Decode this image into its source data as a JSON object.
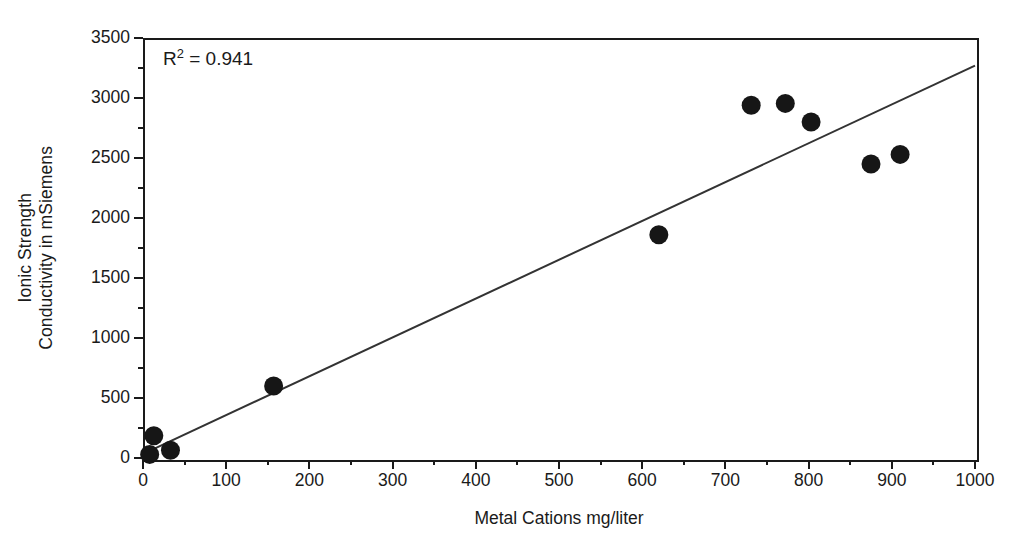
{
  "chart_data": {
    "type": "scatter",
    "title": "",
    "xlabel": "Metal Cations mg/liter",
    "ylabel": "Ionic Strength\nConductivity in mSiemens",
    "ylabel_lines": [
      "Ionic Strength",
      "Conductivity in mSiemens"
    ],
    "xlim": [
      0,
      1000
    ],
    "ylim": [
      0,
      3500
    ],
    "xticks": [
      0,
      100,
      200,
      300,
      400,
      500,
      600,
      700,
      800,
      900,
      1000
    ],
    "yticks": [
      0,
      500,
      1000,
      1500,
      2000,
      2500,
      3000,
      3500
    ],
    "xtick_labels": [
      "0",
      "100",
      "200",
      "300",
      "400",
      "500",
      "600",
      "700",
      "800",
      "900",
      "1000"
    ],
    "ytick_labels": [
      "0",
      "500",
      "1000",
      "1500",
      "2000",
      "2500",
      "3000",
      "3500"
    ],
    "x_minor_ticks": [
      50,
      150,
      250,
      350,
      450,
      550,
      650,
      750,
      850,
      950
    ],
    "y_minor_ticks": [
      250,
      750,
      1250,
      1750,
      2250,
      2750,
      3250
    ],
    "grid": false,
    "legend": false,
    "legend_position": "none",
    "marker": "filled-circle",
    "marker_color": "#161616",
    "marker_size_px": 19,
    "points": [
      {
        "x": 8,
        "y": 30
      },
      {
        "x": 13,
        "y": 185
      },
      {
        "x": 33,
        "y": 65
      },
      {
        "x": 157,
        "y": 600
      },
      {
        "x": 620,
        "y": 1860
      },
      {
        "x": 731,
        "y": 2940
      },
      {
        "x": 772,
        "y": 2955
      },
      {
        "x": 803,
        "y": 2800
      },
      {
        "x": 875,
        "y": 2450
      },
      {
        "x": 910,
        "y": 2530
      }
    ],
    "series": [
      {
        "name": "Ionic Strength vs Metal Cations",
        "x": [
          8,
          13,
          33,
          157,
          620,
          731,
          772,
          803,
          875,
          910
        ],
        "values": [
          30,
          185,
          65,
          600,
          1860,
          2940,
          2955,
          2800,
          2450,
          2530
        ]
      }
    ],
    "trendline": {
      "type": "linear",
      "color": "#333333",
      "x_start": 8,
      "y_start": 60,
      "x_end": 1000,
      "y_end": 3270,
      "slope": 3.236,
      "intercept": 34
    },
    "annotations": [
      {
        "name": "r-squared",
        "text_prefix": "R",
        "text_sup": "2",
        "text_suffix": " = 0.941",
        "full_text": "R2 = 0.941",
        "value": 0.941,
        "x_px": 163,
        "y_px": 48
      }
    ],
    "frame": {
      "left_px": 143,
      "top_px": 38,
      "width_px": 832,
      "height_px": 420,
      "border_color": "#1a1a1a"
    }
  }
}
